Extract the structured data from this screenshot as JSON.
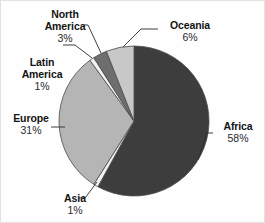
{
  "chart_data": {
    "type": "pie",
    "title": "",
    "subtitle": "",
    "xlabel": "",
    "ylabel": "",
    "legend_position": "none",
    "labels_position": "outside-with-leader-lines",
    "grid": false,
    "categories": [
      "Africa",
      "Asia",
      "Europe",
      "Latin America",
      "North America",
      "Oceania"
    ],
    "values": [
      58,
      1,
      31,
      1,
      3,
      6
    ],
    "unit": "%",
    "start_angle_deg": 0,
    "direction": "clockwise",
    "slices": [
      {
        "label": "Africa",
        "value": 58,
        "pct_text": "58%",
        "color": "#3d3d3d",
        "start_deg": 0,
        "end_deg": 208.8
      },
      {
        "label": "Asia",
        "value": 1,
        "pct_text": "1%",
        "color": "#f2f2f2",
        "start_deg": 208.8,
        "end_deg": 212.4
      },
      {
        "label": "Europe",
        "value": 31,
        "pct_text": "31%",
        "color": "#b5b5b5",
        "start_deg": 212.4,
        "end_deg": 324.0
      },
      {
        "label": "Latin America",
        "value": 1,
        "pct_text": "1%",
        "color": "#f2f2f2",
        "start_deg": 324.0,
        "end_deg": 327.6
      },
      {
        "label": "North America",
        "value": 3,
        "pct_text": "3%",
        "color": "#6e6e6e",
        "start_deg": 327.6,
        "end_deg": 338.4
      },
      {
        "label": "Oceania",
        "value": 6,
        "pct_text": "6%",
        "color": "#c8c8c8",
        "start_deg": 338.4,
        "end_deg": 360.0
      }
    ]
  },
  "labels": {
    "north_america": {
      "name": "North\nAmerica",
      "name_line1": "North",
      "name_line2": "America",
      "pct": "3%"
    },
    "latin_america": {
      "name": "Latin\nAmerica",
      "name_line1": "Latin",
      "name_line2": "America",
      "pct": "1%"
    },
    "europe": {
      "name": "Europe",
      "pct": "31%"
    },
    "asia": {
      "name": "Asia",
      "pct": "1%"
    },
    "oceania": {
      "name": "Oceania",
      "pct": "6%"
    },
    "africa": {
      "name": "Africa",
      "pct": "58%"
    }
  },
  "colors": {
    "africa": "#3d3d3d",
    "asia": "#f2f2f2",
    "europe": "#b5b5b5",
    "latin_america": "#f2f2f2",
    "north_america": "#6e6e6e",
    "oceania": "#c8c8c8",
    "outline": "#4a4a4a",
    "leader_line": "#2b2b2b",
    "text": "#141414",
    "background": "#fefefe"
  }
}
